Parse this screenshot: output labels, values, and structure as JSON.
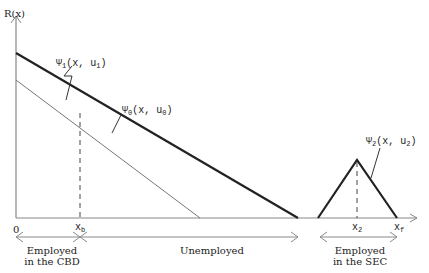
{
  "diagram": {
    "y_axis_label": "R(x)",
    "origin_label": "0",
    "ticks": {
      "xb": {
        "base": "x",
        "sub": "b"
      },
      "x2": {
        "base": "x",
        "sub": "2"
      },
      "xf": {
        "base": "x",
        "sub": "f"
      }
    },
    "curves": {
      "psi1": {
        "sym": "Ψ",
        "sub": "1",
        "args": "(x, u",
        "argsub": "1",
        "close": ")"
      },
      "psi0": {
        "sym": "Ψ",
        "sub": "0",
        "args": "(x, u",
        "argsub": "0",
        "close": ")"
      },
      "psi2": {
        "sym": "Ψ",
        "sub": "2",
        "args": "(x, u",
        "argsub": "2",
        "close": ")"
      }
    },
    "zones": {
      "cbd_line1": "Employed",
      "cbd_line2": "in the CBD",
      "unemployed": "Unemployed",
      "sec_line1": "Employed",
      "sec_line2": "in the SEC"
    },
    "colors": {
      "thick": "#222222",
      "thin": "#777777",
      "axis": "#888888"
    }
  }
}
